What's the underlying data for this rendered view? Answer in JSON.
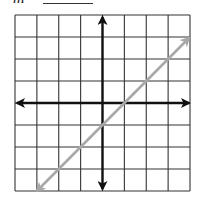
{
  "prompt": {
    "label": "m =",
    "blank": ""
  },
  "chart_data": {
    "type": "line",
    "title": "",
    "xlabel": "",
    "ylabel": "",
    "grid": true,
    "grid_cells": {
      "columns": 8,
      "rows": 8
    },
    "xlim": [
      -4,
      4
    ],
    "ylim": [
      -4,
      4
    ],
    "axes": {
      "x_axis_at": 0,
      "y_axis_at": 0,
      "arrows": true
    },
    "series": [
      {
        "name": "line",
        "equation": "y = x - 1",
        "slope": 1,
        "intercept": -1,
        "x": [
          -3,
          4
        ],
        "y": [
          -4,
          3
        ],
        "color": "#a8a8a8",
        "arrows": true
      }
    ]
  },
  "colors": {
    "grid": "#333333",
    "axes": "#111111",
    "line": "#a8a8a8"
  }
}
